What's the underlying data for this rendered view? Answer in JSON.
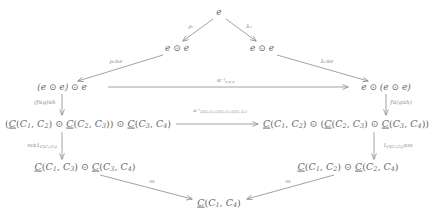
{
  "diagram": {
    "type": "commutative-diagram",
    "nodes": [
      {
        "id": "top-e",
        "label": "e",
        "x": 219,
        "y": 12
      },
      {
        "id": "mid-left-ee",
        "label": "e ⊙ e",
        "x": 177,
        "y": 48
      },
      {
        "id": "mid-right-ee",
        "label": "e ⊙ e",
        "x": 262,
        "y": 48
      },
      {
        "id": "left-eee",
        "label": "(e ⊙ e) ⊙ e",
        "x": 62,
        "y": 87
      },
      {
        "id": "right-eee",
        "label": "e ⊙ (e ⊙ e)",
        "x": 386,
        "y": 87
      },
      {
        "id": "left-hom3",
        "label": "(C(C₁, C₂) ⊙ C(C₂, C₃)) ⊙ C(C₃, C₄)",
        "x": 88,
        "y": 124
      },
      {
        "id": "right-hom3",
        "label": "C(C₁, C₂) ⊙ (C(C₂, C₃) ⊙ C(C₃, C₄))",
        "x": 346,
        "y": 124
      },
      {
        "id": "left-hom2",
        "label": "C(C₁, C₃) ⊙ C(C₃, C₄)",
        "x": 85,
        "y": 167
      },
      {
        "id": "right-hom2",
        "label": "C(C₁, C₂) ⊙ C(C₂, C₄)",
        "x": 348,
        "y": 167
      },
      {
        "id": "bottom-hom",
        "label": "C(C₁, C₄)",
        "x": 219,
        "y": 203
      }
    ],
    "edge_labels": {
      "rho_e": "ρₑ",
      "lambda_e": "λₑ",
      "rho_e_odot_e": "ρₑ⊙e",
      "lambda_e_odot_e": "λₑ⊙e",
      "alpha_inv": "α⁻¹",
      "alpha_inv_sub": "C(C₁,C₂),C(C₂,C₃),C(C₃,C₄)",
      "f_g_h_left": "(f⊙g)⊙h",
      "f_g_h_right": "f⊙(g⊙h)",
      "m_odot_id": "m⊙1",
      "m_odot_id_sub": "C(C₃,C₄)",
      "id_odot_m": "1",
      "id_odot_m_sub": "C(C₁,C₂)",
      "id_odot_m_tail": "⊙m",
      "m_left": "m",
      "m_right": "m"
    },
    "colors": {
      "stroke": "#8a8a8a",
      "text": "#6a6a6a",
      "label_text": "#7d7d7d",
      "background": "#ffffff"
    }
  }
}
